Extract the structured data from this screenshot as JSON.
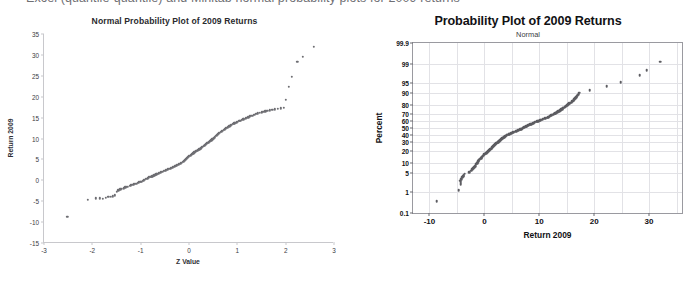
{
  "page": {
    "caption_partial": "Excel (quantile-quantile) and Minitab normal probability plots for 2009 returns"
  },
  "chart_data": [
    {
      "id": "excel_qq",
      "type": "scatter",
      "title": "Normal Probability Plot of 2009 Returns",
      "subtitle": "",
      "xlabel": "Z Value",
      "ylabel": "Return 2009",
      "xlim": [
        -3,
        3
      ],
      "ylim": [
        -15,
        35
      ],
      "xticks": [
        -3,
        -2,
        -1,
        0,
        1,
        2,
        3
      ],
      "xtick_labels": [
        "-3",
        "-2",
        "-1",
        "0",
        "1",
        "2",
        "3"
      ],
      "yticks": [
        -15,
        -10,
        -5,
        0,
        5,
        10,
        15,
        20,
        25,
        30,
        35
      ],
      "ytick_labels": [
        "-15",
        "-10",
        "-5",
        "0",
        "5",
        "10",
        "15",
        "20",
        "25",
        "30",
        "35"
      ],
      "grid": false,
      "legend": "none",
      "marker_color": "#6e6e73",
      "points": [
        [
          -2.52,
          -8.7
        ],
        [
          -2.1,
          -4.7
        ],
        [
          -1.93,
          -4.3
        ],
        [
          -1.84,
          -4.3
        ],
        [
          -1.78,
          -4.4
        ],
        [
          -1.72,
          -4.2
        ],
        [
          -1.67,
          -4.0
        ],
        [
          -1.62,
          -3.9
        ],
        [
          -1.58,
          -3.8
        ],
        [
          -1.54,
          -3.6
        ],
        [
          -1.5,
          -2.8
        ],
        [
          -1.46,
          -2.4
        ],
        [
          -1.42,
          -2.2
        ],
        [
          -1.39,
          -2.0
        ],
        [
          -1.35,
          -1.9
        ],
        [
          -1.32,
          -1.7
        ],
        [
          -1.29,
          -1.6
        ],
        [
          -1.26,
          -1.5
        ],
        [
          -1.23,
          -1.3
        ],
        [
          -1.2,
          -1.2
        ],
        [
          -1.17,
          -1.1
        ],
        [
          -1.14,
          -1.0
        ],
        [
          -1.12,
          -0.9
        ],
        [
          -1.09,
          -0.8
        ],
        [
          -1.06,
          -0.6
        ],
        [
          -1.04,
          -0.5
        ],
        [
          -1.01,
          -0.4
        ],
        [
          -0.99,
          -0.3
        ],
        [
          -0.96,
          -0.1
        ],
        [
          -0.94,
          0.0
        ],
        [
          -0.92,
          0.1
        ],
        [
          -0.89,
          0.3
        ],
        [
          -0.87,
          0.4
        ],
        [
          -0.85,
          0.5
        ],
        [
          -0.83,
          0.7
        ],
        [
          -0.8,
          0.8
        ],
        [
          -0.78,
          0.9
        ],
        [
          -0.76,
          1.0
        ],
        [
          -0.74,
          1.1
        ],
        [
          -0.72,
          1.2
        ],
        [
          -0.7,
          1.3
        ],
        [
          -0.68,
          1.4
        ],
        [
          -0.66,
          1.5
        ],
        [
          -0.64,
          1.6
        ],
        [
          -0.62,
          1.7
        ],
        [
          -0.6,
          1.8
        ],
        [
          -0.58,
          1.9
        ],
        [
          -0.56,
          2.0
        ],
        [
          -0.54,
          2.1
        ],
        [
          -0.52,
          2.2
        ],
        [
          -0.5,
          2.3
        ],
        [
          -0.48,
          2.4
        ],
        [
          -0.46,
          2.5
        ],
        [
          -0.44,
          2.6
        ],
        [
          -0.42,
          2.7
        ],
        [
          -0.4,
          2.8
        ],
        [
          -0.38,
          2.9
        ],
        [
          -0.36,
          3.0
        ],
        [
          -0.34,
          3.1
        ],
        [
          -0.32,
          3.2
        ],
        [
          -0.3,
          3.3
        ],
        [
          -0.28,
          3.4
        ],
        [
          -0.27,
          3.5
        ],
        [
          -0.25,
          3.6
        ],
        [
          -0.23,
          3.7
        ],
        [
          -0.21,
          3.8
        ],
        [
          -0.19,
          3.9
        ],
        [
          -0.17,
          4.1
        ],
        [
          -0.15,
          4.2
        ],
        [
          -0.13,
          4.4
        ],
        [
          -0.11,
          4.5
        ],
        [
          -0.09,
          4.7
        ],
        [
          -0.08,
          4.9
        ],
        [
          -0.06,
          5.1
        ],
        [
          -0.04,
          5.3
        ],
        [
          -0.02,
          5.5
        ],
        [
          0.0,
          5.7
        ],
        [
          0.02,
          5.9
        ],
        [
          0.04,
          6.0
        ],
        [
          0.06,
          6.2
        ],
        [
          0.08,
          6.4
        ],
        [
          0.09,
          6.5
        ],
        [
          0.11,
          6.7
        ],
        [
          0.13,
          6.8
        ],
        [
          0.15,
          7.0
        ],
        [
          0.17,
          7.1
        ],
        [
          0.19,
          7.3
        ],
        [
          0.21,
          7.4
        ],
        [
          0.23,
          7.6
        ],
        [
          0.25,
          7.7
        ],
        [
          0.27,
          7.9
        ],
        [
          0.28,
          8.0
        ],
        [
          0.3,
          8.2
        ],
        [
          0.32,
          8.3
        ],
        [
          0.34,
          8.5
        ],
        [
          0.36,
          8.7
        ],
        [
          0.38,
          8.9
        ],
        [
          0.4,
          9.0
        ],
        [
          0.42,
          9.2
        ],
        [
          0.44,
          9.4
        ],
        [
          0.46,
          9.6
        ],
        [
          0.48,
          9.8
        ],
        [
          0.5,
          10.0
        ],
        [
          0.52,
          10.2
        ],
        [
          0.54,
          10.4
        ],
        [
          0.56,
          10.6
        ],
        [
          0.58,
          10.8
        ],
        [
          0.6,
          11.0
        ],
        [
          0.62,
          11.2
        ],
        [
          0.64,
          11.4
        ],
        [
          0.66,
          11.6
        ],
        [
          0.68,
          11.7
        ],
        [
          0.7,
          11.9
        ],
        [
          0.72,
          12.1
        ],
        [
          0.74,
          12.2
        ],
        [
          0.76,
          12.4
        ],
        [
          0.78,
          12.6
        ],
        [
          0.8,
          12.7
        ],
        [
          0.83,
          12.9
        ],
        [
          0.85,
          13.0
        ],
        [
          0.87,
          13.2
        ],
        [
          0.89,
          13.3
        ],
        [
          0.92,
          13.5
        ],
        [
          0.94,
          13.6
        ],
        [
          0.96,
          13.8
        ],
        [
          0.99,
          13.9
        ],
        [
          1.01,
          14.0
        ],
        [
          1.04,
          14.2
        ],
        [
          1.06,
          14.3
        ],
        [
          1.09,
          14.4
        ],
        [
          1.12,
          14.6
        ],
        [
          1.14,
          14.7
        ],
        [
          1.17,
          14.8
        ],
        [
          1.2,
          15.0
        ],
        [
          1.23,
          15.1
        ],
        [
          1.26,
          15.3
        ],
        [
          1.29,
          15.4
        ],
        [
          1.32,
          15.5
        ],
        [
          1.35,
          15.7
        ],
        [
          1.39,
          15.9
        ],
        [
          1.42,
          16.0
        ],
        [
          1.46,
          16.2
        ],
        [
          1.5,
          16.3
        ],
        [
          1.54,
          16.4
        ],
        [
          1.58,
          16.5
        ],
        [
          1.62,
          16.6
        ],
        [
          1.67,
          16.7
        ],
        [
          1.72,
          16.8
        ],
        [
          1.78,
          17.0
        ],
        [
          1.84,
          17.1
        ],
        [
          1.9,
          17.2
        ],
        [
          1.96,
          17.3
        ],
        [
          2.0,
          19.2
        ],
        [
          2.06,
          22.3
        ],
        [
          2.13,
          24.8
        ],
        [
          2.24,
          28.3
        ],
        [
          2.35,
          29.6
        ],
        [
          2.58,
          32.0
        ]
      ]
    },
    {
      "id": "minitab_probplot",
      "type": "scatter",
      "title": "Probability Plot of 2009 Returns",
      "subtitle": "Normal",
      "xlabel": "Return 2009",
      "ylabel": "Percent",
      "xlim": [
        -13,
        36
      ],
      "xticks": [
        -10,
        0,
        10,
        20,
        30
      ],
      "xtick_labels": [
        "-10",
        "0",
        "10",
        "20",
        "30"
      ],
      "ytick_labels": [
        "99.9",
        "99",
        "95",
        "90",
        "80",
        "70",
        "60",
        "50",
        "40",
        "30",
        "20",
        "10",
        "5",
        "1",
        "0.1"
      ],
      "ytick_percents": [
        99.9,
        99,
        95,
        90,
        80,
        70,
        60,
        50,
        40,
        30,
        20,
        10,
        5,
        1,
        0.1
      ],
      "yscale": "normal-probability",
      "grid": true,
      "legend": "none",
      "marker_color": "#5c5c61",
      "points": [
        [
          -8.7,
          0.4
        ],
        [
          -4.7,
          1.2
        ],
        [
          -4.3,
          2.0
        ],
        [
          -4.3,
          2.4
        ],
        [
          -4.4,
          2.8
        ],
        [
          -4.2,
          3.2
        ],
        [
          -4.0,
          3.6
        ],
        [
          -3.9,
          4.0
        ],
        [
          -3.8,
          4.4
        ],
        [
          -3.6,
          4.8
        ],
        [
          -2.8,
          5.4
        ],
        [
          -2.4,
          6.0
        ],
        [
          -2.2,
          6.6
        ],
        [
          -2.0,
          7.2
        ],
        [
          -1.9,
          7.8
        ],
        [
          -1.7,
          8.4
        ],
        [
          -1.6,
          9.0
        ],
        [
          -1.5,
          9.6
        ],
        [
          -1.3,
          10.2
        ],
        [
          -1.2,
          10.8
        ],
        [
          -1.1,
          11.4
        ],
        [
          -1.0,
          12.0
        ],
        [
          -0.9,
          12.6
        ],
        [
          -0.8,
          13.2
        ],
        [
          -0.6,
          13.8
        ],
        [
          -0.5,
          14.4
        ],
        [
          -0.4,
          15.0
        ],
        [
          -0.3,
          15.6
        ],
        [
          -0.1,
          16.2
        ],
        [
          0.0,
          16.8
        ],
        [
          0.1,
          17.4
        ],
        [
          0.3,
          18.0
        ],
        [
          0.4,
          18.6
        ],
        [
          0.5,
          19.2
        ],
        [
          0.7,
          19.8
        ],
        [
          0.8,
          20.4
        ],
        [
          0.9,
          21.0
        ],
        [
          1.0,
          21.6
        ],
        [
          1.1,
          22.2
        ],
        [
          1.2,
          22.8
        ],
        [
          1.3,
          23.4
        ],
        [
          1.4,
          24.0
        ],
        [
          1.5,
          24.6
        ],
        [
          1.6,
          25.2
        ],
        [
          1.7,
          25.8
        ],
        [
          1.8,
          26.4
        ],
        [
          1.9,
          27.0
        ],
        [
          2.0,
          27.6
        ],
        [
          2.1,
          28.2
        ],
        [
          2.2,
          28.8
        ],
        [
          2.3,
          29.4
        ],
        [
          2.4,
          30.0
        ],
        [
          2.5,
          30.6
        ],
        [
          2.6,
          31.2
        ],
        [
          2.7,
          31.8
        ],
        [
          2.8,
          32.4
        ],
        [
          2.9,
          33.0
        ],
        [
          3.0,
          33.6
        ],
        [
          3.1,
          34.2
        ],
        [
          3.2,
          34.8
        ],
        [
          3.3,
          35.4
        ],
        [
          3.4,
          36.0
        ],
        [
          3.5,
          36.6
        ],
        [
          3.6,
          37.2
        ],
        [
          3.7,
          37.8
        ],
        [
          3.8,
          38.4
        ],
        [
          3.9,
          39.0
        ],
        [
          4.1,
          39.6
        ],
        [
          4.2,
          40.2
        ],
        [
          4.4,
          40.8
        ],
        [
          4.5,
          41.4
        ],
        [
          4.7,
          42.0
        ],
        [
          4.9,
          42.6
        ],
        [
          5.1,
          43.2
        ],
        [
          5.3,
          43.8
        ],
        [
          5.5,
          44.4
        ],
        [
          5.7,
          45.0
        ],
        [
          5.9,
          45.6
        ],
        [
          6.0,
          46.2
        ],
        [
          6.2,
          46.8
        ],
        [
          6.4,
          47.4
        ],
        [
          6.5,
          48.0
        ],
        [
          6.7,
          48.6
        ],
        [
          6.8,
          49.2
        ],
        [
          7.0,
          49.8
        ],
        [
          7.1,
          50.4
        ],
        [
          7.3,
          51.0
        ],
        [
          7.4,
          51.6
        ],
        [
          7.6,
          52.2
        ],
        [
          7.7,
          52.8
        ],
        [
          7.9,
          53.4
        ],
        [
          8.0,
          54.0
        ],
        [
          8.2,
          54.6
        ],
        [
          8.3,
          55.2
        ],
        [
          8.5,
          55.8
        ],
        [
          8.7,
          56.4
        ],
        [
          8.9,
          57.0
        ],
        [
          9.0,
          57.6
        ],
        [
          9.2,
          58.2
        ],
        [
          9.4,
          58.8
        ],
        [
          9.6,
          59.4
        ],
        [
          9.8,
          60.0
        ],
        [
          10.0,
          60.6
        ],
        [
          10.2,
          61.2
        ],
        [
          10.4,
          61.8
        ],
        [
          10.6,
          62.4
        ],
        [
          10.8,
          63.0
        ],
        [
          11.0,
          63.6
        ],
        [
          11.2,
          64.2
        ],
        [
          11.4,
          64.8
        ],
        [
          11.6,
          65.4
        ],
        [
          11.7,
          66.0
        ],
        [
          11.9,
          66.6
        ],
        [
          12.1,
          67.2
        ],
        [
          12.2,
          67.8
        ],
        [
          12.4,
          68.4
        ],
        [
          12.6,
          69.0
        ],
        [
          12.7,
          69.6
        ],
        [
          12.9,
          70.2
        ],
        [
          13.0,
          70.8
        ],
        [
          13.2,
          71.4
        ],
        [
          13.3,
          72.0
        ],
        [
          13.5,
          72.6
        ],
        [
          13.6,
          73.2
        ],
        [
          13.8,
          73.8
        ],
        [
          13.9,
          74.4
        ],
        [
          14.0,
          75.0
        ],
        [
          14.2,
          75.6
        ],
        [
          14.3,
          76.2
        ],
        [
          14.4,
          76.8
        ],
        [
          14.6,
          77.4
        ],
        [
          14.7,
          78.0
        ],
        [
          14.8,
          78.6
        ],
        [
          15.0,
          79.2
        ],
        [
          15.1,
          79.8
        ],
        [
          15.3,
          80.4
        ],
        [
          15.4,
          81.0
        ],
        [
          15.5,
          81.6
        ],
        [
          15.7,
          82.2
        ],
        [
          15.9,
          82.8
        ],
        [
          16.0,
          83.4
        ],
        [
          16.2,
          84.0
        ],
        [
          16.3,
          84.6
        ],
        [
          16.4,
          85.2
        ],
        [
          16.5,
          85.8
        ],
        [
          16.6,
          86.4
        ],
        [
          16.7,
          87.0
        ],
        [
          16.8,
          87.6
        ],
        [
          17.0,
          88.2
        ],
        [
          17.1,
          88.8
        ],
        [
          17.2,
          89.4
        ],
        [
          17.3,
          90.0
        ],
        [
          19.2,
          91.5
        ],
        [
          22.3,
          93.5
        ],
        [
          24.8,
          95.2
        ],
        [
          28.3,
          97.2
        ],
        [
          29.6,
          98.2
        ],
        [
          32.0,
          99.2
        ]
      ]
    }
  ]
}
